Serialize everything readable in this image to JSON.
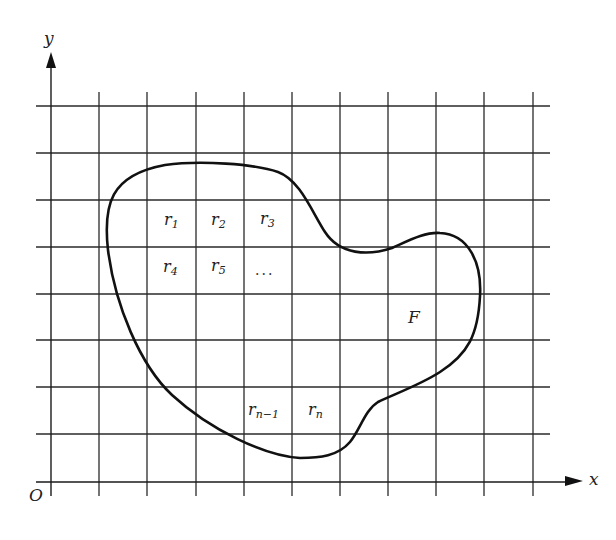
{
  "figure": {
    "axes": {
      "x_label": "x",
      "y_label": "y",
      "origin_label": "O"
    },
    "region_label": "F",
    "cells": [
      {
        "base": "r",
        "sub": "1"
      },
      {
        "base": "r",
        "sub": "2"
      },
      {
        "base": "r",
        "sub": "3"
      },
      {
        "base": "r",
        "sub": "4"
      },
      {
        "base": "r",
        "sub": "5"
      },
      {
        "base": "r",
        "sub": "n−1"
      },
      {
        "base": "r",
        "sub": "n"
      }
    ],
    "ellipsis": "...",
    "grid": {
      "vertical_lines": 11,
      "horizontal_lines": 8,
      "line_color": "#2a2a2a",
      "curve_color": "#111111"
    }
  }
}
